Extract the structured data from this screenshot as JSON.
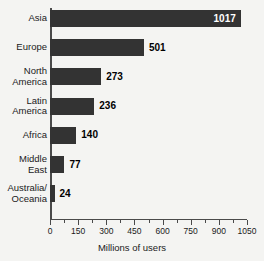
{
  "chart_data": {
    "type": "bar",
    "orientation": "horizontal",
    "title": "",
    "xlabel": "Millions of users",
    "ylabel": "",
    "categories": [
      "Asia",
      "Europe",
      "North\nAmerica",
      "Latin\nAmerica",
      "Africa",
      "Middle\nEast",
      "Australia/\nOceania"
    ],
    "values": [
      1017,
      501,
      273,
      236,
      140,
      77,
      24
    ],
    "value_labels": [
      "1017",
      "501",
      "273",
      "236",
      "140",
      "77",
      "24"
    ],
    "label_placement": [
      "inside",
      "outside",
      "outside",
      "outside",
      "outside",
      "outside",
      "outside"
    ],
    "xlim": [
      0,
      1050
    ],
    "xticks": [
      0,
      150,
      300,
      450,
      600,
      750,
      900,
      1050
    ],
    "xtick_labels": [
      "0",
      "150",
      "300",
      "450",
      "600",
      "750",
      "900",
      "1050"
    ],
    "minor_tick_interval": 75,
    "grid": false,
    "legend": null,
    "colors": {
      "bar": "#333333",
      "background": "#f4f4f2",
      "axis": "#4a4a4a",
      "text": "#1a1a1a",
      "value_label_inside": "#ffffff",
      "value_label_outside": "#000000"
    }
  }
}
